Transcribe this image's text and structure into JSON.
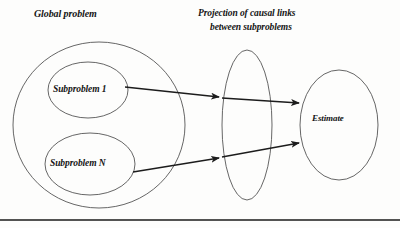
{
  "diagram": {
    "labels": {
      "global_problem": "Global problem",
      "projection_line1": "Projection of causal links",
      "projection_line2": "between subproblems",
      "subproblem_1": "Subproblem 1",
      "subproblem_n": "Subproblem N",
      "estimate": "Estimate"
    },
    "colors": {
      "stroke": "#4a4a4a",
      "arrow": "#1c1c1c",
      "text": "#141414",
      "background": "#fdfdfc",
      "frame": "#1a1a1a"
    },
    "shapes": [
      {
        "name": "global-problem-ellipse",
        "type": "ellipse",
        "cx": 99,
        "cy": 125,
        "rx": 86,
        "ry": 83
      },
      {
        "name": "subproblem-1-ellipse",
        "type": "ellipse",
        "cx": 88,
        "cy": 90,
        "rx": 40,
        "ry": 28
      },
      {
        "name": "subproblem-n-ellipse",
        "type": "ellipse",
        "cx": 90,
        "cy": 164,
        "rx": 45,
        "ry": 31
      },
      {
        "name": "projection-ellipse",
        "type": "ellipse",
        "cx": 247,
        "cy": 125,
        "rx": 25,
        "ry": 75
      },
      {
        "name": "estimate-ellipse",
        "type": "ellipse",
        "cx": 339,
        "cy": 125,
        "rx": 39,
        "ry": 55
      }
    ],
    "arrows": [
      {
        "name": "arrow-subproblem-1-to-projection",
        "x1": 125,
        "y1": 87,
        "x2": 218,
        "y2": 97
      },
      {
        "name": "arrow-projection-to-estimate-upper",
        "x1": 247,
        "y1": 100,
        "x2": 298,
        "y2": 103
      },
      {
        "name": "arrow-subproblem-n-to-projection",
        "x1": 133,
        "y1": 172,
        "x2": 218,
        "y2": 158
      },
      {
        "name": "arrow-projection-to-estimate-lower",
        "x1": 247,
        "y1": 153,
        "x2": 298,
        "y2": 143
      }
    ],
    "frame": {
      "name": "bottom-frame-line",
      "y": 220
    }
  }
}
